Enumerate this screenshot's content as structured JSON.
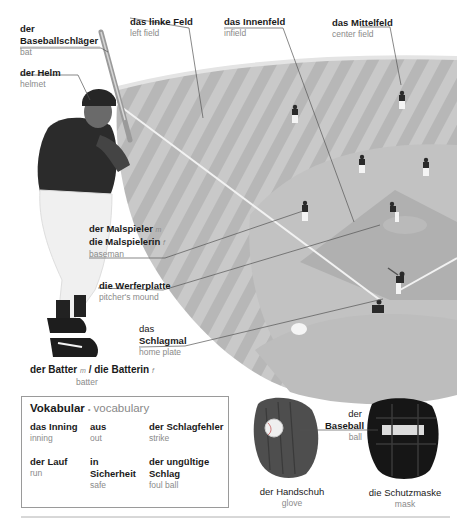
{
  "labels": {
    "bat": {
      "de": [
        "der",
        "Baseballschläger"
      ],
      "en": "bat"
    },
    "helmet": {
      "de": "der Helm",
      "en": "helmet"
    },
    "left_field": {
      "de": "das linke Feld",
      "en": "left field"
    },
    "infield": {
      "de": "das Innenfeld",
      "en": "infield"
    },
    "center_field": {
      "de": "das Mittelfeld",
      "en": "center field"
    },
    "baseman": {
      "de_m": "der Malspieler",
      "g_m": "m",
      "de_f": "die Malspielerin",
      "g_f": "f",
      "en": "baseman"
    },
    "mound": {
      "de": "die Werferplatte",
      "en": "pitcher's mound"
    },
    "home_plate": {
      "de": [
        "das",
        "Schlagmal"
      ],
      "en": "home plate"
    },
    "batter": {
      "de_m": "der Batter",
      "g_m": "m",
      "sep": "/",
      "de_f": "die Batterin",
      "g_f": "f",
      "en": "batter"
    },
    "ball": {
      "de": [
        "der",
        "Baseball"
      ],
      "en": "ball"
    },
    "glove": {
      "de": "der Handschuh",
      "en": "glove"
    },
    "mask": {
      "de": "die Schutzmaske",
      "en": "mask"
    }
  },
  "vocab": {
    "title_de": "Vokabular",
    "bullet": "•",
    "title_en": "vocabulary",
    "items": [
      {
        "de": "das Inning",
        "en": "inning"
      },
      {
        "de": "aus",
        "en": "out"
      },
      {
        "de": "der Schlagfehler",
        "en": "strike"
      },
      {
        "de": "der Lauf",
        "en": "run"
      },
      {
        "de": "in Sicherheit",
        "en": "safe"
      },
      {
        "de": "der ungültige Schlag",
        "en": "foul ball"
      }
    ]
  },
  "colors": {
    "field_light": "#c8c8c8",
    "field_dark": "#b4b4b4",
    "text_de": "#1a1a1a",
    "text_en": "#8a8a8a"
  }
}
